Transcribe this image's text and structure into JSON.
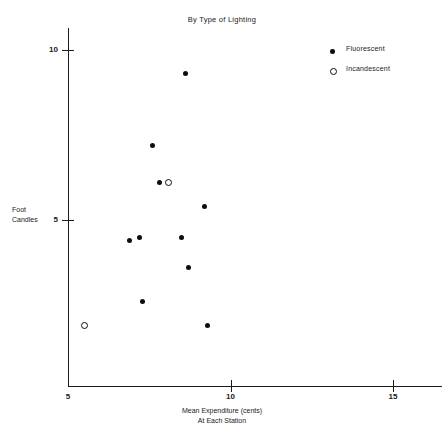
{
  "chart_data": {
    "type": "scatter",
    "title": "By Type of Lighting",
    "xlabel_lines": [
      "Mean Expenditure (cents)",
      "At Each Station"
    ],
    "ylabel_lines": [
      "Foot",
      "Candles"
    ],
    "xlim": [
      5,
      16
    ],
    "ylim": [
      0.1,
      10.6
    ],
    "xticks": [
      5,
      10,
      15
    ],
    "xtick_labels": [
      "5",
      "10",
      "15"
    ],
    "yticks": [
      5,
      10
    ],
    "ytick_labels": [
      "5",
      "10"
    ],
    "grid": false,
    "legend_position": "top-right",
    "series": [
      {
        "name": "Fluorescent",
        "marker": "filled-circle",
        "color": "#0d0d0d",
        "points": [
          {
            "x": 8.6,
            "y": 9.3
          },
          {
            "x": 7.6,
            "y": 7.2
          },
          {
            "x": 7.8,
            "y": 6.1
          },
          {
            "x": 9.2,
            "y": 5.4
          },
          {
            "x": 6.9,
            "y": 4.4
          },
          {
            "x": 7.2,
            "y": 4.5
          },
          {
            "x": 8.5,
            "y": 4.5
          },
          {
            "x": 8.7,
            "y": 3.6
          },
          {
            "x": 7.3,
            "y": 2.6
          },
          {
            "x": 9.3,
            "y": 1.9
          }
        ]
      },
      {
        "name": "Incandescent",
        "marker": "open-circle",
        "color": "#0d0d0d",
        "points": [
          {
            "x": 8.1,
            "y": 6.1
          },
          {
            "x": 5.5,
            "y": 1.9
          }
        ]
      }
    ]
  },
  "legend": {
    "entries": [
      {
        "label": "Fluorescent",
        "marker": "filled-circle"
      },
      {
        "label": "Incandescent",
        "marker": "open-circle"
      }
    ]
  }
}
